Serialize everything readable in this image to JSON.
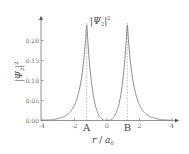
{
  "chart_data": {
    "type": "line",
    "title": "",
    "xlabel": "r / a_0",
    "ylabel": "|Ψ_2|^2",
    "xlim": [
      -4,
      4.2
    ],
    "ylim": [
      0,
      0.25
    ],
    "xticks": [
      -4,
      -2,
      0,
      2,
      4
    ],
    "xtick_labels": [
      "-4",
      "-2",
      "0",
      "2",
      "4"
    ],
    "yticks": [
      0.0,
      0.05,
      0.1,
      0.15,
      0.2
    ],
    "ytick_labels": [
      "0.00",
      "0.05",
      "0.10",
      "0.15",
      "0.20"
    ],
    "grid": false,
    "series": [
      {
        "name": "|Ψ_2|^2",
        "x": [
          -4,
          -3.5,
          -3,
          -2.5,
          -2,
          -1.75,
          -1.5,
          -1.25,
          -1.0,
          -0.75,
          -0.5,
          -0.25,
          0,
          0.25,
          0.5,
          0.75,
          1.0,
          1.25,
          1.5,
          1.75,
          2,
          2.5,
          3,
          3.5,
          4
        ],
        "values": [
          0.005,
          0.009,
          0.016,
          0.029,
          0.053,
          0.077,
          0.125,
          0.245,
          0.13,
          0.05,
          0.018,
          0.004,
          0.0,
          0.004,
          0.018,
          0.05,
          0.13,
          0.245,
          0.125,
          0.077,
          0.053,
          0.029,
          0.016,
          0.009,
          0.005
        ]
      }
    ],
    "annotations": [
      {
        "text": "A",
        "x": -1.25,
        "type": "dashed-vertical"
      },
      {
        "text": "B",
        "x": 1.25,
        "type": "dashed-vertical"
      },
      {
        "text": "|Ψ_2|^2",
        "position": "near-peak-label"
      }
    ]
  },
  "labels": {
    "curve_label_main": "|Ψ",
    "curve_label_sub": "2",
    "curve_label_close": "|",
    "curve_label_sup": "2",
    "ylabel_main": "|Ψ",
    "ylabel_sub": "2",
    "ylabel_close": "|",
    "ylabel_sup": "2",
    "xlabel_r": "r",
    "xlabel_slash": " / ",
    "xlabel_a": "a",
    "xlabel_sub": "0",
    "point_a": "A",
    "point_b": "B"
  },
  "colors": {
    "curve": "#8a8a8a",
    "axis": "#555555",
    "text": "#555555"
  }
}
